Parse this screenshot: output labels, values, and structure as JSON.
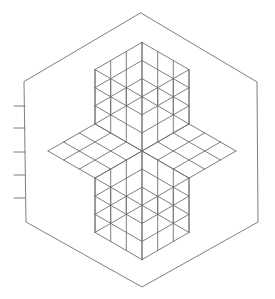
{
  "diagram": {
    "colors": {
      "background": "#ffffff",
      "stroke": "#6f6f6f"
    },
    "center": [
      142,
      151
    ],
    "hexagon": {
      "vertices": [
        [
          141,
          13
        ],
        [
          257,
          82
        ],
        [
          258,
          222
        ],
        [
          142,
          287
        ],
        [
          26,
          222
        ],
        [
          24,
          82
        ]
      ]
    },
    "grid_divisions": 3,
    "inner_half_size": 60,
    "left_ticks": {
      "x1": 14,
      "x2": 25,
      "y": [
        106,
        128,
        152,
        175,
        198
      ]
    }
  }
}
